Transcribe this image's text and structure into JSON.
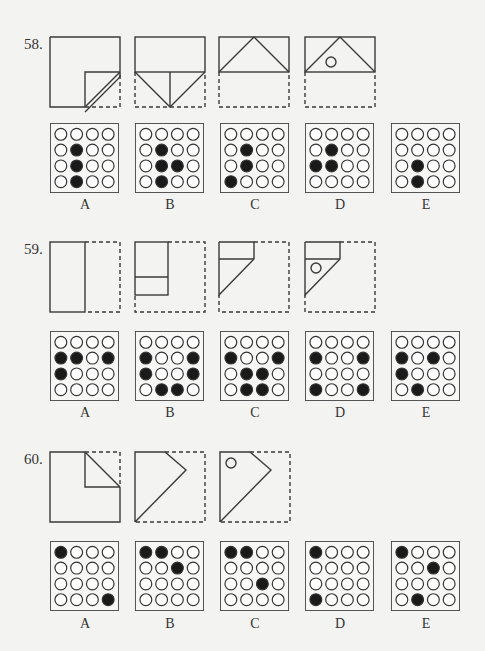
{
  "questions": [
    {
      "number": "58.",
      "diagrams": [
        {
          "step": 1,
          "description": "square folded: bottom-right quadrant corner folded diagonally",
          "punch_hole": false
        },
        {
          "step": 2,
          "description": "bottom half folded up with diagonal folds meeting at bottom center",
          "punch_hole": false
        },
        {
          "step": 3,
          "description": "top rectangle with triangle peak",
          "punch_hole": false
        },
        {
          "step": 4,
          "description": "top rectangle with triangle peak and punched hole",
          "punch_hole": true
        }
      ],
      "options": [
        {
          "label": "A",
          "filled": [
            [
              1,
              1
            ],
            [
              2,
              1
            ],
            [
              3,
              1
            ]
          ]
        },
        {
          "label": "B",
          "filled": [
            [
              1,
              1
            ],
            [
              2,
              1
            ],
            [
              2,
              2
            ],
            [
              3,
              1
            ]
          ]
        },
        {
          "label": "C",
          "filled": [
            [
              1,
              1
            ],
            [
              2,
              1
            ],
            [
              3,
              0
            ]
          ]
        },
        {
          "label": "D",
          "filled": [
            [
              1,
              1
            ],
            [
              2,
              0
            ],
            [
              2,
              1
            ]
          ]
        },
        {
          "label": "E",
          "filled": [
            [
              2,
              1
            ],
            [
              3,
              1
            ]
          ]
        }
      ]
    },
    {
      "number": "59.",
      "diagrams": [
        {
          "step": 1,
          "description": "square folded in half vertically, right half dashed",
          "punch_hole": false
        },
        {
          "step": 2,
          "description": "left half folded with horizontal fold",
          "punch_hole": false
        },
        {
          "step": 3,
          "description": "top strip with diagonal fold",
          "punch_hole": false
        },
        {
          "step": 4,
          "description": "top strip with diagonal fold and punched hole",
          "punch_hole": true
        }
      ],
      "options": [
        {
          "label": "A",
          "filled": [
            [
              1,
              0
            ],
            [
              1,
              1
            ],
            [
              1,
              3
            ],
            [
              2,
              0
            ]
          ]
        },
        {
          "label": "B",
          "filled": [
            [
              1,
              0
            ],
            [
              1,
              3
            ],
            [
              2,
              0
            ],
            [
              2,
              3
            ],
            [
              3,
              1
            ],
            [
              3,
              2
            ]
          ]
        },
        {
          "label": "C",
          "filled": [
            [
              1,
              0
            ],
            [
              1,
              3
            ],
            [
              2,
              1
            ],
            [
              2,
              2
            ],
            [
              3,
              1
            ],
            [
              3,
              2
            ]
          ]
        },
        {
          "label": "D",
          "filled": [
            [
              1,
              0
            ],
            [
              1,
              3
            ],
            [
              3,
              0
            ],
            [
              3,
              3
            ]
          ]
        },
        {
          "label": "E",
          "filled": [
            [
              1,
              0
            ],
            [
              1,
              2
            ],
            [
              2,
              0
            ],
            [
              3,
              1
            ]
          ]
        }
      ]
    },
    {
      "number": "60.",
      "diagrams": [
        {
          "step": 1,
          "description": "square with top-right corner folded diagonally",
          "punch_hole": false
        },
        {
          "step": 2,
          "description": "pentagon shape after diagonal fold",
          "punch_hole": false
        },
        {
          "step": 3,
          "description": "pentagon shape with punched hole",
          "punch_hole": true
        }
      ],
      "options": [
        {
          "label": "A",
          "filled": [
            [
              0,
              0
            ],
            [
              3,
              3
            ]
          ]
        },
        {
          "label": "B",
          "filled": [
            [
              0,
              0
            ],
            [
              0,
              1
            ],
            [
              1,
              2
            ]
          ]
        },
        {
          "label": "C",
          "filled": [
            [
              0,
              0
            ],
            [
              0,
              1
            ],
            [
              2,
              2
            ]
          ]
        },
        {
          "label": "D",
          "filled": [
            [
              0,
              0
            ],
            [
              3,
              0
            ]
          ]
        },
        {
          "label": "E",
          "filled": [
            [
              0,
              0
            ],
            [
              1,
              2
            ],
            [
              3,
              1
            ]
          ]
        }
      ]
    }
  ],
  "colors": {
    "line": "#3a3a3a",
    "dot_fill": "#1a1a1a",
    "dot_empty": "#ffffff",
    "background": "#f3f3f1"
  }
}
